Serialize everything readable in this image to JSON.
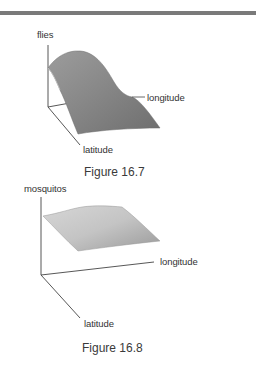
{
  "page": {
    "figures": [
      {
        "caption": "Figure 16.7",
        "axes": {
          "vertical": "flies",
          "horizontal": "longitude",
          "depth": "latitude"
        },
        "surface": "smooth hill peaking near the origin-side edge, sloping down toward longitude"
      },
      {
        "caption": "Figure 16.8",
        "axes": {
          "vertical": "mosquitos",
          "horizontal": "longitude",
          "depth": "latitude"
        },
        "surface": "nearly flat elevated sheet with gentle ridge"
      }
    ]
  }
}
